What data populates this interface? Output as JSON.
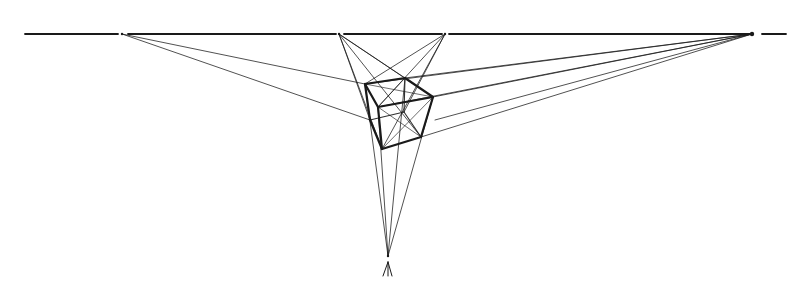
{
  "diagram": {
    "type": "three-point-perspective-cube",
    "width": 806,
    "height": 299,
    "background": "#ffffff",
    "ink_color": "#1a1a1a",
    "horizon": {
      "y": 34,
      "segments": [
        [
          25,
          118
        ],
        [
          128,
          336
        ],
        [
          344,
          442
        ],
        [
          449,
          750
        ],
        [
          762,
          786
        ]
      ]
    },
    "vanishing_points": {
      "left": [
        122,
        34
      ],
      "center_left": [
        339,
        34
      ],
      "center_right": [
        445,
        34
      ],
      "right": [
        752,
        34
      ],
      "bottom": [
        388,
        256
      ]
    },
    "cube": {
      "vertices": {
        "A": [
          365,
          84
        ],
        "B": [
          405,
          78
        ],
        "C": [
          433,
          97
        ],
        "D": [
          378,
          107
        ],
        "E": [
          421,
          137
        ],
        "F": [
          382,
          149
        ],
        "G": [
          370,
          120
        ],
        "H": [
          404,
          112
        ]
      },
      "edges": [
        [
          "A",
          "B"
        ],
        [
          "B",
          "C"
        ],
        [
          "C",
          "D"
        ],
        [
          "D",
          "A"
        ],
        [
          "A",
          "G"
        ],
        [
          "G",
          "F"
        ],
        [
          "D",
          "F"
        ],
        [
          "F",
          "E"
        ],
        [
          "E",
          "C"
        ]
      ],
      "hidden_edges": [
        [
          "B",
          "H"
        ],
        [
          "H",
          "G"
        ],
        [
          "H",
          "E"
        ]
      ]
    },
    "construction_lines_from_left": [
      [
        365,
        84
      ],
      [
        370,
        120
      ]
    ],
    "construction_lines_from_right": [
      [
        365,
        84
      ],
      [
        405,
        78
      ],
      [
        433,
        97
      ],
      [
        378,
        107
      ],
      [
        421,
        137
      ]
    ],
    "construction_lines_from_center_left": [
      [
        405,
        78
      ],
      [
        433,
        97
      ],
      [
        421,
        137
      ],
      [
        382,
        149
      ],
      [
        370,
        120
      ]
    ],
    "construction_lines_from_center_right": [
      [
        365,
        84
      ],
      [
        378,
        107
      ],
      [
        382,
        149
      ],
      [
        404,
        112
      ]
    ],
    "construction_lines_to_bottom": [
      [
        365,
        84
      ],
      [
        405,
        78
      ],
      [
        433,
        97
      ],
      [
        378,
        107
      ]
    ],
    "diagonals": [
      [
        [
          365,
          84
        ],
        [
          433,
          97
        ]
      ],
      [
        [
          405,
          78
        ],
        [
          378,
          107
        ]
      ],
      [
        [
          378,
          107
        ],
        [
          421,
          137
        ]
      ],
      [
        [
          433,
          97
        ],
        [
          382,
          149
        ]
      ]
    ],
    "bottom_marker": {
      "x": 388,
      "y": 262,
      "height": 14
    }
  }
}
